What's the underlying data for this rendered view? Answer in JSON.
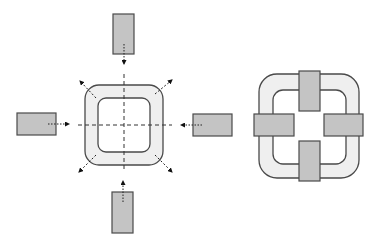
{
  "diagram": {
    "colors": {
      "background": "#ffffff",
      "stroke": "#4a4a4a",
      "ring_fill": "#efefef",
      "block_fill": "#c4c4c4",
      "axis": "#333333"
    },
    "exploded_view": {
      "ring": {
        "outer": {
          "x": 85,
          "y": 85,
          "w": 78,
          "h": 80,
          "r": 14
        },
        "inner": {
          "x": 98,
          "y": 98,
          "w": 52,
          "h": 54,
          "r": 8
        }
      },
      "center": {
        "x": 124,
        "y": 125
      },
      "blocks": [
        {
          "id": "top",
          "x": 113,
          "y": 14,
          "w": 21,
          "h": 40,
          "arrow": {
            "x1": 124,
            "y1": 44,
            "x2": 124,
            "y2": 64
          }
        },
        {
          "id": "left",
          "x": 17,
          "y": 113,
          "w": 39,
          "h": 22,
          "arrow": {
            "x1": 48,
            "y1": 124,
            "x2": 69,
            "y2": 124
          }
        },
        {
          "id": "right",
          "x": 193,
          "y": 114,
          "w": 39,
          "h": 22,
          "arrow": {
            "x1": 202,
            "y1": 125,
            "x2": 181,
            "y2": 125
          }
        },
        {
          "id": "bottom",
          "x": 112,
          "y": 192,
          "w": 21,
          "h": 41,
          "arrow": {
            "x1": 123,
            "y1": 202,
            "x2": 123,
            "y2": 181
          }
        }
      ],
      "expansion_arrows": [
        {
          "id": "nw",
          "x1": 96,
          "y1": 98,
          "x2": 80,
          "y2": 81
        },
        {
          "id": "ne",
          "x1": 155,
          "y1": 94,
          "x2": 172,
          "y2": 80
        },
        {
          "id": "sw",
          "x1": 96,
          "y1": 155,
          "x2": 79,
          "y2": 172
        },
        {
          "id": "se",
          "x1": 155,
          "y1": 155,
          "x2": 172,
          "y2": 172
        }
      ],
      "axes": {
        "h": {
          "x1": 78,
          "x2": 172,
          "y": 125
        },
        "v": {
          "x": 124,
          "y1": 74,
          "y2": 172
        }
      }
    },
    "assembled_view": {
      "ring": {
        "outer": {
          "x": 259,
          "y": 74,
          "w": 100,
          "h": 104,
          "r": 18
        },
        "inner": {
          "x": 273,
          "y": 90,
          "w": 73,
          "h": 74,
          "r": 10
        }
      },
      "blocks": [
        {
          "id": "top",
          "x": 299,
          "y": 71,
          "w": 21,
          "h": 40
        },
        {
          "id": "left",
          "x": 254,
          "y": 114,
          "w": 40,
          "h": 22
        },
        {
          "id": "right",
          "x": 324,
          "y": 114,
          "w": 39,
          "h": 22
        },
        {
          "id": "bottom",
          "x": 299,
          "y": 141,
          "w": 21,
          "h": 40
        }
      ]
    }
  }
}
